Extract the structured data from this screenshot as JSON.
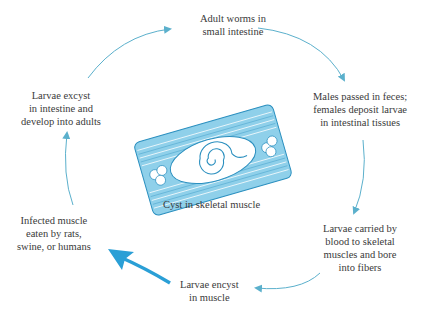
{
  "diagram": {
    "type": "life-cycle",
    "colors": {
      "arrow": "#5bb0cc",
      "arrow_bold": "#2a9fd6",
      "cyst_fill": "#7fc8e6",
      "cyst_stroke": "#2a8fbf",
      "text": "#3a3a3a"
    },
    "stages": [
      {
        "id": "adult",
        "lines": [
          "Adult worms in",
          "small intestine"
        ]
      },
      {
        "id": "males",
        "lines": [
          "Males passed in feces;",
          "females deposit larvae",
          "in intestinal tissues"
        ]
      },
      {
        "id": "carried",
        "lines": [
          "Larvae carried by",
          "blood to skeletal",
          "muscles and bore",
          "into fibers"
        ]
      },
      {
        "id": "encyst",
        "lines": [
          "Larvae encyst",
          "in muscle"
        ]
      },
      {
        "id": "infected",
        "lines": [
          "Infected muscle",
          "eaten by rats,",
          "swine, or humans"
        ]
      },
      {
        "id": "excyst",
        "lines": [
          "Larvae excyst",
          "in intestine and",
          "develop into adults"
        ]
      }
    ],
    "center_caption": "Cyst in skeletal muscle",
    "icons": {
      "cyst": "cyst-in-muscle-illustration",
      "arrow": "cycle-arrow",
      "bold_arrow": "bold-arrow"
    }
  }
}
